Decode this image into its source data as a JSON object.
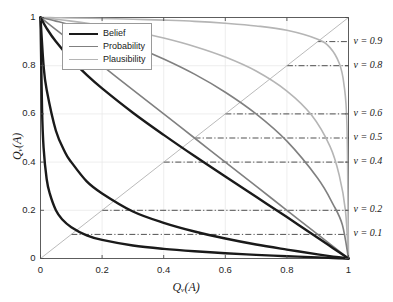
{
  "chart_data": {
    "type": "line",
    "title": "",
    "xlabel": "Q_ν(A)",
    "xlabel_display": "Qᵥ(A)",
    "ylabel": "Q_ν(A)",
    "ylabel_display": "Qᵥ(A)",
    "xlim": [
      0,
      1
    ],
    "ylim": [
      0,
      1
    ],
    "xticks": [
      "0",
      "0.2",
      "0.4",
      "0.6",
      "0.8",
      "1"
    ],
    "xtick_values": [
      0,
      0.2,
      0.4,
      0.6,
      0.8,
      1
    ],
    "yticks": [
      "0",
      "0.2",
      "0.4",
      "0.6",
      "0.8",
      "1"
    ],
    "ytick_values": [
      0,
      0.2,
      0.4,
      0.6,
      0.8,
      1
    ],
    "grid": true,
    "legend_position": "top-left-inside",
    "legend": [
      {
        "label": "Belief",
        "color": "#1a1a1a",
        "width": 2.4
      },
      {
        "label": "Probability",
        "color": "#808080",
        "width": 1.6
      },
      {
        "label": "Plausibility",
        "color": "#b5b5b5",
        "width": 1.6
      }
    ],
    "diagonal": {
      "from": [
        0,
        0
      ],
      "to": [
        1,
        1
      ],
      "color": "#a8a8a8",
      "style": "solid"
    },
    "nu_levels": [
      {
        "nu": 0.9,
        "label": "ν = 0.9",
        "y": 0.9
      },
      {
        "nu": 0.8,
        "label": "ν = 0.8",
        "y": 0.8
      },
      {
        "nu": 0.6,
        "label": "ν = 0.6",
        "y": 0.6
      },
      {
        "nu": 0.5,
        "label": "ν = 0.5",
        "y": 0.5
      },
      {
        "nu": 0.4,
        "label": "ν = 0.4",
        "y": 0.4
      },
      {
        "nu": 0.2,
        "label": "ν = 0.2",
        "y": 0.2
      },
      {
        "nu": 0.1,
        "label": "ν = 0.1",
        "y": 0.1
      }
    ],
    "level_line_style": "dash-dot",
    "level_line_color": "#333333",
    "series": [
      {
        "name": "Belief ν=0.1",
        "family": "Belief",
        "color": "#1a1a1a",
        "width": 2.4,
        "nu": 0.1,
        "x": [
          0,
          0.005,
          0.01,
          0.02,
          0.03,
          0.05,
          0.07,
          0.1,
          0.15,
          0.2,
          0.3,
          0.4,
          0.5,
          0.6,
          0.7,
          0.8,
          0.9,
          0.95,
          1
        ],
        "y": [
          1,
          0.62,
          0.46,
          0.33,
          0.27,
          0.2,
          0.163,
          0.13,
          0.096,
          0.077,
          0.054,
          0.04,
          0.03,
          0.022,
          0.015,
          0.0096,
          0.0045,
          0.0021,
          0
        ]
      },
      {
        "name": "Belief ν=0.4",
        "family": "Belief",
        "color": "#1a1a1a",
        "width": 2.4,
        "nu": 0.4,
        "x": [
          0,
          0.01,
          0.02,
          0.05,
          0.08,
          0.1,
          0.15,
          0.2,
          0.3,
          0.4,
          0.5,
          0.6,
          0.7,
          0.8,
          0.9,
          0.95,
          1
        ],
        "y": [
          1,
          0.8,
          0.7,
          0.53,
          0.44,
          0.4,
          0.32,
          0.27,
          0.195,
          0.148,
          0.112,
          0.083,
          0.058,
          0.037,
          0.017,
          0.008,
          0
        ]
      },
      {
        "name": "Belief ν=0.8",
        "family": "Belief",
        "color": "#1a1a1a",
        "width": 2.4,
        "nu": 0.8,
        "x": [
          0,
          0.02,
          0.05,
          0.1,
          0.15,
          0.2,
          0.3,
          0.4,
          0.5,
          0.6,
          0.7,
          0.8,
          0.9,
          0.95,
          1
        ],
        "y": [
          1,
          0.955,
          0.9,
          0.825,
          0.762,
          0.706,
          0.605,
          0.513,
          0.425,
          0.34,
          0.256,
          0.172,
          0.086,
          0.043,
          0
        ]
      },
      {
        "name": "Probability ν=0.5",
        "family": "Probability",
        "color": "#808080",
        "width": 1.6,
        "nu": 0.5,
        "x": [
          0,
          0.05,
          0.1,
          0.2,
          0.3,
          0.4,
          0.5,
          0.6,
          0.7,
          0.8,
          0.9,
          0.95,
          1
        ],
        "y": [
          1,
          0.95,
          0.9,
          0.8,
          0.7,
          0.6,
          0.5,
          0.4,
          0.3,
          0.2,
          0.1,
          0.05,
          0
        ]
      },
      {
        "name": "Probability ν=0.6",
        "family": "Probability",
        "color": "#808080",
        "width": 1.6,
        "nu": 0.6,
        "x": [
          0,
          0.05,
          0.1,
          0.2,
          0.3,
          0.4,
          0.5,
          0.6,
          0.7,
          0.8,
          0.9,
          0.95,
          0.98,
          1
        ],
        "y": [
          1,
          0.985,
          0.968,
          0.928,
          0.882,
          0.828,
          0.765,
          0.69,
          0.6,
          0.487,
          0.333,
          0.225,
          0.14,
          0
        ]
      },
      {
        "name": "Plausibility ν=0.8",
        "family": "Plausibility",
        "color": "#b5b5b5",
        "width": 1.6,
        "nu": 0.8,
        "x": [
          0,
          0.02,
          0.05,
          0.1,
          0.2,
          0.3,
          0.4,
          0.5,
          0.6,
          0.7,
          0.8,
          0.88,
          0.94,
          0.97,
          0.99,
          1
        ],
        "y": [
          1,
          0.997,
          0.993,
          0.985,
          0.966,
          0.943,
          0.915,
          0.88,
          0.836,
          0.778,
          0.695,
          0.595,
          0.465,
          0.345,
          0.2,
          0
        ]
      },
      {
        "name": "Plausibility ν=0.9",
        "family": "Plausibility",
        "color": "#b5b5b5",
        "width": 1.6,
        "nu": 0.9,
        "x": [
          0,
          0.05,
          0.1,
          0.2,
          0.3,
          0.4,
          0.5,
          0.6,
          0.7,
          0.8,
          0.9,
          0.94,
          0.97,
          0.985,
          0.995,
          1
        ],
        "y": [
          1,
          0.999,
          0.998,
          0.996,
          0.993,
          0.989,
          0.984,
          0.976,
          0.965,
          0.947,
          0.91,
          0.875,
          0.81,
          0.725,
          0.55,
          0
        ]
      }
    ]
  },
  "axes": {
    "x_tick_labels": [
      "0",
      "0.2",
      "0.4",
      "0.6",
      "0.8",
      "1"
    ],
    "y_tick_labels": [
      "0",
      "0.2",
      "0.4",
      "0.6",
      "0.8",
      "1"
    ]
  }
}
